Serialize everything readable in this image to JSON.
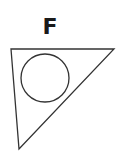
{
  "diagram": {
    "label": "F",
    "triangle": {
      "points": "11,49 114,49 19,149",
      "stroke": "#333333"
    },
    "circle": {
      "cx": 45,
      "cy": 78,
      "r": 24,
      "stroke": "#333333"
    }
  }
}
